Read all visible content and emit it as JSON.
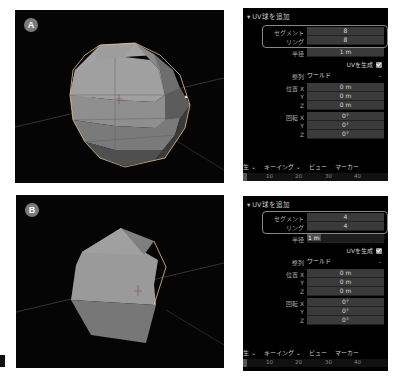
{
  "panels": [
    {
      "badge": "A",
      "viewport": {
        "object": "uv-sphere",
        "segments": 8,
        "rings": 8
      },
      "operator": {
        "title": "UV球を追加",
        "segments_label": "セグメント",
        "segments_value": "8",
        "rings_label": "リング",
        "rings_value": "8",
        "radius_label": "半径",
        "radius_value": "1 m",
        "generate_uv_label": "UVを生成",
        "generate_uv_checked": true,
        "align_label": "整列",
        "align_value": "ワールド",
        "location_label": "位置 X",
        "location_x": "0 m",
        "y_label": "Y",
        "location_y": "0 m",
        "z_label": "Z",
        "location_z": "0 m",
        "rotation_label": "回転 X",
        "rotation_x": "0°",
        "rotation_y": "0°",
        "rotation_z": "0°"
      },
      "menu": [
        "生 ⌄",
        "キーイング ⌄",
        "ビュー",
        "マーカー"
      ],
      "timeline_ticks": [
        "10",
        "20",
        "30",
        "40"
      ]
    },
    {
      "badge": "B",
      "viewport": {
        "object": "uv-sphere",
        "segments": 4,
        "rings": 4
      },
      "operator": {
        "title": "UV球を追加",
        "segments_label": "セグメント",
        "segments_value": "4",
        "rings_label": "リング",
        "rings_value": "4",
        "radius_label": "半径",
        "radius_value": "1 m",
        "generate_uv_label": "UVを生成",
        "generate_uv_checked": true,
        "align_label": "整列",
        "align_value": "ワールド",
        "location_label": "位置 X",
        "location_x": "0 m",
        "y_label": "Y",
        "location_y": "0 m",
        "z_label": "Z",
        "location_z": "0 m",
        "rotation_label": "回転 X",
        "rotation_x": "0°",
        "rotation_y": "0°",
        "rotation_z": "0°"
      },
      "menu": [
        "生 ⌄",
        "キーイング ⌄",
        "ビュー",
        "マーカー"
      ],
      "timeline_ticks": [
        "10",
        "20",
        "30",
        "40"
      ]
    }
  ],
  "colors": {
    "viewport_bg": "#050505",
    "mesh_light": "#9a9a9a",
    "mesh_mid": "#7c7c7c",
    "mesh_dark": "#4a4a4a",
    "selection_outline": "#e8c48a",
    "field_bg": "#3a3a3a"
  }
}
